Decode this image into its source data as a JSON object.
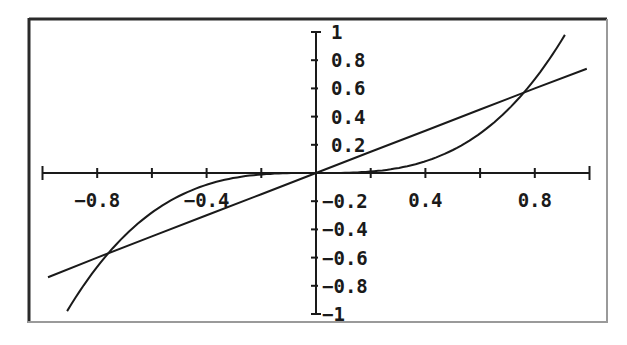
{
  "chart_data": {
    "type": "line",
    "title": "",
    "xlabel": "",
    "ylabel": "",
    "xlim": [
      -1,
      1
    ],
    "ylim": [
      -1,
      1
    ],
    "grid": false,
    "legend": null,
    "x_tick_step": 0.2,
    "y_tick_step": 0.2,
    "x_tick_labels": [
      {
        "value": -0.8,
        "label": "-0.8"
      },
      {
        "value": -0.4,
        "label": "-0.4"
      },
      {
        "value": 0.4,
        "label": "0.4"
      },
      {
        "value": 0.8,
        "label": "0.8"
      }
    ],
    "y_tick_labels": [
      {
        "value": 1,
        "label": "1"
      },
      {
        "value": 0.8,
        "label": "0.8"
      },
      {
        "value": 0.6,
        "label": "0.6"
      },
      {
        "value": 0.4,
        "label": "0.4"
      },
      {
        "value": 0.2,
        "label": "0.2"
      },
      {
        "value": -0.2,
        "label": "-0.2"
      },
      {
        "value": -0.4,
        "label": "-0.4"
      },
      {
        "value": -0.6,
        "label": "-0.6"
      },
      {
        "value": -0.8,
        "label": "-0.8"
      },
      {
        "value": -1,
        "label": "-1"
      }
    ],
    "series": [
      {
        "name": "linear",
        "description": "straight line through origin, y ≈ 0.75x",
        "x": [
          -0.98,
          -0.8,
          -0.6,
          -0.4,
          -0.2,
          0,
          0.2,
          0.4,
          0.6,
          0.8,
          0.99
        ],
        "y": [
          -0.74,
          -0.6,
          -0.45,
          -0.3,
          -0.15,
          0,
          0.15,
          0.3,
          0.45,
          0.6,
          0.74
        ]
      },
      {
        "name": "cubic",
        "description": "cubic curve through origin, y ≈ 1.3x^3",
        "x": [
          -0.91,
          -0.8,
          -0.7,
          -0.6,
          -0.5,
          -0.4,
          -0.3,
          -0.2,
          -0.1,
          0,
          0.1,
          0.2,
          0.3,
          0.4,
          0.5,
          0.6,
          0.7,
          0.8,
          0.91
        ],
        "y": [
          -0.98,
          -0.67,
          -0.45,
          -0.28,
          -0.16,
          -0.08,
          -0.035,
          -0.01,
          -0.001,
          0,
          0.001,
          0.01,
          0.035,
          0.08,
          0.16,
          0.28,
          0.45,
          0.67,
          0.98
        ]
      }
    ],
    "intersections": [
      {
        "x": -0.76,
        "y": -0.57
      },
      {
        "x": 0,
        "y": 0
      },
      {
        "x": 0.76,
        "y": 0.57
      }
    ]
  }
}
